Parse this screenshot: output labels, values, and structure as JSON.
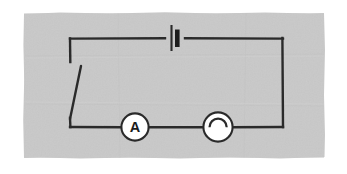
{
  "figure": {
    "kind": "circuit-diagram",
    "background_color": "#ffffff",
    "paper_color": "#c9c9c9",
    "paper_edge_color": "#d6d6d6",
    "ink_color": "#2b2b2b",
    "component_fill_color": "#ffffff",
    "paper_rect": {
      "x": 23,
      "y": 12,
      "width": 302,
      "height": 146
    }
  },
  "circuit": {
    "loop": {
      "left": 70,
      "right": 283,
      "top": 38,
      "bottom": 127,
      "wire_width": 2.4
    },
    "components": [
      {
        "id": "battery",
        "name": "battery",
        "label": "",
        "symbol": "battery-cell",
        "x": 175,
        "y": 38,
        "long_plate_x": 171,
        "long_plate_height": 26,
        "short_plate_x": 177,
        "short_plate_height": 17,
        "short_plate_width": 4.5,
        "gap_half_width": 10
      },
      {
        "id": "switch",
        "name": "open-switch",
        "label": "",
        "symbol": "switch-open",
        "pivot_x": 70,
        "pivot_y": 120,
        "blade_end_x": 81,
        "blade_end_y": 66,
        "contact_x": 70,
        "contact_y": 62
      },
      {
        "id": "ammeter",
        "name": "ammeter",
        "label": "A",
        "symbol": "circle-with-letter",
        "cx": 135,
        "cy": 127,
        "r": 13.5,
        "font_size": 14
      },
      {
        "id": "bell",
        "name": "electric-bell",
        "label": "",
        "symbol": "circle-with-dome",
        "cx": 218,
        "cy": 127,
        "r": 14.5,
        "dome_r": 8.5
      }
    ]
  }
}
